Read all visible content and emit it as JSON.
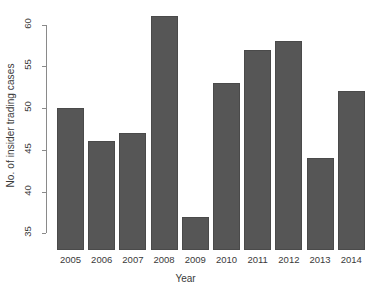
{
  "chart_data": {
    "type": "bar",
    "title": "",
    "subtitle": "",
    "xlabel": "Year",
    "ylabel": "No. of insider trading cases",
    "categories": [
      "2005",
      "2006",
      "2007",
      "2008",
      "2009",
      "2010",
      "2011",
      "2012",
      "2013",
      "2014"
    ],
    "values": [
      50,
      46,
      47,
      61,
      37,
      53,
      57,
      58,
      44,
      52
    ],
    "ylim": [
      33,
      61.5
    ],
    "yticks": [
      35,
      40,
      45,
      50,
      55,
      60
    ],
    "ytick_labels": [
      "35",
      "40",
      "45",
      "50",
      "55",
      "60"
    ],
    "grid": false,
    "legend": null,
    "bar_color": "#565656",
    "axis_color": "#8a8a8a",
    "text_color": "#3a3a3a",
    "background": "#ffffff",
    "note": "y-axis is truncated; bars are drawn from below the 35 tick"
  }
}
